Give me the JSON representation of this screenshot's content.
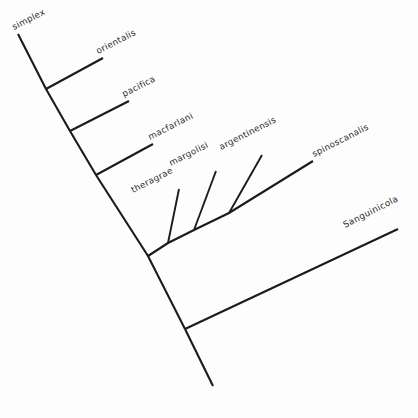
{
  "figure": {
    "type": "phylogenetic-cladogram",
    "orientation_degrees": -25,
    "background_color": "#fdfdfd",
    "line_color": "#1b1b1b",
    "text_color": "#2a2a2a"
  },
  "taxa": [
    {
      "id": "simplex",
      "label": "simplex",
      "tip_x": 18,
      "tip_y": 34,
      "label_x": 14,
      "label_y": 30,
      "rotation": -27
    },
    {
      "id": "orientalis",
      "label": "orientalis",
      "tip_x": 103,
      "tip_y": 58,
      "label_x": 98,
      "label_y": 54,
      "rotation": -27
    },
    {
      "id": "pacifica",
      "label": "pacifica",
      "tip_x": 129,
      "tip_y": 101,
      "label_x": 124,
      "label_y": 97,
      "rotation": -27
    },
    {
      "id": "macfarlani",
      "label": "macfarlani",
      "tip_x": 153,
      "tip_y": 144,
      "label_x": 150,
      "label_y": 140,
      "rotation": -27
    },
    {
      "id": "theragrae",
      "label": "theragrae",
      "tip_x": 179,
      "tip_y": 189,
      "label_x": 133,
      "label_y": 193,
      "rotation": -27
    },
    {
      "id": "margolisi",
      "label": "margolisi",
      "tip_x": 216,
      "tip_y": 171,
      "label_x": 171,
      "label_y": 166,
      "rotation": -27
    },
    {
      "id": "argentinensis",
      "label": "argentinensis",
      "tip_x": 262,
      "tip_y": 155,
      "label_x": 221,
      "label_y": 150,
      "rotation": -27
    },
    {
      "id": "spinoscanalis",
      "label": "spinoscanalis",
      "tip_x": 313,
      "tip_y": 161,
      "label_x": 314,
      "label_y": 157,
      "rotation": -27
    },
    {
      "id": "sanguinicola",
      "label": "Sanguinicola",
      "tip_x": 398,
      "tip_y": 229,
      "label_x": 345,
      "label_y": 228,
      "rotation": -27
    }
  ],
  "nodes": [
    {
      "id": "node-root",
      "x": 185,
      "y": 329
    },
    {
      "id": "node-ingroup",
      "x": 148,
      "y": 256
    },
    {
      "id": "node-macfarlani-clade",
      "x": 96,
      "y": 175
    },
    {
      "id": "node-pacifica-clade",
      "x": 70,
      "y": 131
    },
    {
      "id": "node-orientalis-clade",
      "x": 46,
      "y": 89
    },
    {
      "id": "node-crown",
      "x": 168,
      "y": 243
    },
    {
      "id": "node-margolisi-split",
      "x": 194,
      "y": 230
    },
    {
      "id": "node-argentinensis-split",
      "x": 229,
      "y": 213
    }
  ],
  "backbone": {
    "root_tip_x": 213,
    "root_tip_y": 386,
    "description": "main stem running from simplex tip down to the root"
  }
}
